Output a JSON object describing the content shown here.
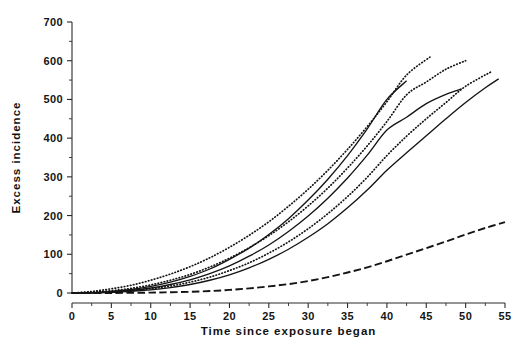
{
  "chart_data": {
    "type": "line",
    "title": "",
    "xlabel": "Time since exposure began",
    "ylabel": "Excess incidence",
    "xlim": [
      0,
      55
    ],
    "ylim": [
      0,
      700
    ],
    "xticks": [
      0,
      5,
      10,
      15,
      20,
      25,
      30,
      35,
      40,
      45,
      50,
      55
    ],
    "yticks": [
      0,
      100,
      200,
      300,
      400,
      500,
      600,
      700
    ],
    "x_minor_step": 2.5,
    "y_minor_step": 50,
    "grid": false,
    "legend": "none",
    "x": [
      0,
      5,
      10,
      15,
      20,
      25,
      30,
      35,
      40,
      45,
      50,
      55
    ],
    "series": [
      {
        "name": "curve-1",
        "style": "dotted",
        "x_end": 45.5,
        "x": [
          0,
          2.5,
          5,
          7.5,
          10,
          12.5,
          15,
          17.5,
          20,
          22.5,
          25,
          27.5,
          30,
          32.5,
          35,
          37.5,
          40,
          42.5,
          45.5
        ],
        "values": [
          0,
          4,
          11,
          20,
          33,
          49,
          68,
          91,
          118,
          149,
          184,
          224,
          268,
          317,
          371,
          430,
          494,
          563,
          610
        ]
      },
      {
        "name": "curve-2",
        "style": "solid",
        "x_end": 42.5,
        "x": [
          0,
          2.5,
          5,
          7.5,
          10,
          12.5,
          15,
          17.5,
          20,
          22.5,
          25,
          27.5,
          30,
          32.5,
          35,
          37.5,
          40,
          42.5
        ],
        "values": [
          0,
          1,
          4,
          9,
          17,
          28,
          43,
          62,
          87,
          116,
          151,
          192,
          240,
          294,
          355,
          424,
          500,
          548
        ]
      },
      {
        "name": "curve-3",
        "style": "dotted",
        "x_end": 50,
        "x": [
          0,
          2.5,
          5,
          7.5,
          10,
          12.5,
          15,
          17.5,
          20,
          22.5,
          25,
          27.5,
          30,
          32.5,
          35,
          37.5,
          40,
          42.5,
          45,
          47.5,
          50
        ],
        "values": [
          0,
          2,
          6,
          12,
          21,
          33,
          48,
          67,
          90,
          117,
          148,
          184,
          225,
          271,
          323,
          380,
          443,
          512,
          545,
          578,
          600
        ]
      },
      {
        "name": "curve-4",
        "style": "solid",
        "x_end": 49.5,
        "x": [
          0,
          2.5,
          5,
          7.5,
          10,
          12.5,
          15,
          17.5,
          20,
          22.5,
          25,
          27.5,
          30,
          32.5,
          35,
          37.5,
          40,
          42.5,
          45,
          47.5,
          49.5
        ],
        "values": [
          0,
          1,
          3,
          7,
          13,
          22,
          34,
          50,
          70,
          95,
          124,
          159,
          199,
          245,
          297,
          356,
          421,
          454,
          489,
          513,
          527
        ]
      },
      {
        "name": "curve-5",
        "style": "dotted",
        "x_end": 53.3,
        "x": [
          0,
          2.5,
          5,
          7.5,
          10,
          12.5,
          15,
          17.5,
          20,
          22.5,
          25,
          27.5,
          30,
          32.5,
          35,
          37.5,
          40,
          42.5,
          45,
          47.5,
          50,
          53.3
        ],
        "values": [
          0,
          1,
          3,
          6,
          11,
          18,
          28,
          41,
          58,
          78,
          103,
          132,
          166,
          205,
          249,
          299,
          355,
          405,
          450,
          492,
          534,
          572
        ]
      },
      {
        "name": "curve-6",
        "style": "solid",
        "x_end": 54.2,
        "x": [
          0,
          2.5,
          5,
          7.5,
          10,
          12.5,
          15,
          17.5,
          20,
          22.5,
          25,
          27.5,
          30,
          32.5,
          35,
          37.5,
          40,
          42.5,
          45,
          47.5,
          50,
          52.5,
          54.2
        ],
        "values": [
          0,
          0,
          2,
          4,
          8,
          14,
          22,
          33,
          47,
          65,
          87,
          113,
          144,
          179,
          220,
          266,
          317,
          362,
          406,
          450,
          492,
          530,
          553
        ]
      },
      {
        "name": "curve-7",
        "style": "dashed",
        "x_end": 55,
        "x": [
          0,
          5,
          10,
          12.5,
          15,
          17.5,
          20,
          22.5,
          25,
          27.5,
          30,
          32.5,
          35,
          37.5,
          40,
          42.5,
          45,
          47.5,
          50,
          52.5,
          55
        ],
        "values": [
          0,
          0,
          1,
          2,
          3,
          5,
          8,
          12,
          17,
          23,
          31,
          41,
          53,
          66,
          82,
          99,
          116,
          133,
          151,
          168,
          183
        ]
      }
    ]
  },
  "axes": {
    "x_title": "Time since exposure began",
    "y_title": "Excess incidence",
    "x_tick_labels": [
      "0",
      "5",
      "10",
      "15",
      "20",
      "25",
      "30",
      "35",
      "40",
      "45",
      "50",
      "55"
    ],
    "y_tick_labels": [
      "0",
      "100",
      "200",
      "300",
      "400",
      "500",
      "600",
      "700"
    ]
  },
  "colors": {
    "axis": "#2b2b2b",
    "curve": "#141414",
    "background": "#ffffff"
  }
}
